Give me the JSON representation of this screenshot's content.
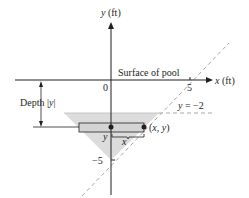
{
  "figure": {
    "y_axis_label": "y (ft)",
    "x_axis_label": "x (ft)",
    "origin_label": "0",
    "tick_x_label": "5",
    "tick_y_label": "−5",
    "surface_label": "Surface of pool",
    "depth_label": "Depth |y|",
    "line_label": "y = −2",
    "point_label": "(x, y)",
    "strip_y_label": "y",
    "strip_x_label": "x",
    "colors": {
      "ink": "#231f20",
      "fill": "#d9d9d9",
      "dashed": "#a9a9a9"
    }
  }
}
